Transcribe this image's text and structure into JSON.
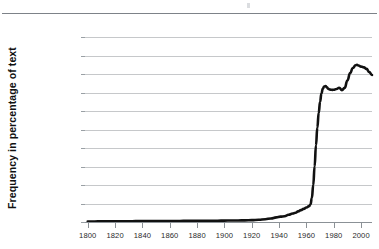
{
  "chart_data": {
    "type": "line",
    "title": "",
    "subtitle": "",
    "xlabel": "",
    "ylabel": "Frequency in percentage of text",
    "xlim": [
      1798,
      2008
    ],
    "ylim": [
      0.0,
      2e-05
    ],
    "grid": true,
    "legend": null,
    "legend_position": "none",
    "x_tick_labels": [
      "1800",
      "1820",
      "1840",
      "1860",
      "1880",
      "1900",
      "1920",
      "1940",
      "1960",
      "1980",
      "2000"
    ],
    "x_ticks": [
      1800,
      1820,
      1840,
      1860,
      1880,
      1900,
      1920,
      1940,
      1960,
      1980,
      2000
    ],
    "y_tick_labels": [
      "0.0000200",
      "0.0000180",
      "0.0000160",
      "0.0000140",
      "0.0000120",
      "0.0000100",
      "0.0000080",
      "0.0000060",
      "0.0000040",
      "0.0000020",
      "0.0000000"
    ],
    "y_ticks": [
      2e-05,
      1.8e-05,
      1.6e-05,
      1.4e-05,
      1.2e-05,
      1e-05,
      8e-06,
      6e-06,
      4e-06,
      2e-06,
      0.0
    ],
    "series": [
      {
        "name": "frequency",
        "color": "#111111",
        "x": [
          1800,
          1805,
          1810,
          1815,
          1820,
          1825,
          1830,
          1835,
          1840,
          1845,
          1850,
          1855,
          1860,
          1865,
          1870,
          1875,
          1880,
          1885,
          1890,
          1895,
          1900,
          1905,
          1910,
          1915,
          1920,
          1925,
          1930,
          1934,
          1938,
          1941,
          1944,
          1947,
          1950,
          1952,
          1954,
          1956,
          1958,
          1960,
          1962,
          1963,
          1964,
          1965,
          1966,
          1967,
          1968,
          1969,
          1970,
          1971,
          1972,
          1973,
          1974,
          1975,
          1976,
          1977,
          1978,
          1979,
          1980,
          1982,
          1984,
          1986,
          1988,
          1990,
          1992,
          1994,
          1996,
          1997,
          1998,
          2000,
          2002,
          2004,
          2006,
          2008
        ],
        "y": [
          6e-08,
          6e-08,
          7e-08,
          7e-08,
          8e-08,
          8e-08,
          8e-08,
          9e-08,
          9e-08,
          1e-07,
          1e-07,
          1e-07,
          1.1e-07,
          1.1e-07,
          1.2e-07,
          1.2e-07,
          1.3e-07,
          1.3e-07,
          1.4e-07,
          1.4e-07,
          1.5e-07,
          1.6e-07,
          1.7e-07,
          1.8e-07,
          2e-07,
          2.4e-07,
          3e-07,
          3.8e-07,
          5e-07,
          5.8e-07,
          6.2e-07,
          7.8e-07,
          9.2e-07,
          1e-06,
          1.15e-06,
          1.28e-06,
          1.42e-06,
          1.56e-06,
          1.72e-06,
          1.9e-06,
          2.6e-06,
          4e-06,
          6e-06,
          8.3e-06,
          1.02e-05,
          1.18e-05,
          1.3e-05,
          1.39e-05,
          1.44e-05,
          1.465e-05,
          1.47e-05,
          1.455e-05,
          1.44e-05,
          1.432e-05,
          1.43e-05,
          1.428e-05,
          1.43e-05,
          1.438e-05,
          1.452e-05,
          1.425e-05,
          1.45e-05,
          1.53e-05,
          1.61e-05,
          1.665e-05,
          1.695e-05,
          1.7e-05,
          1.692e-05,
          1.68e-05,
          1.672e-05,
          1.655e-05,
          1.62e-05,
          1.59e-05
        ]
      }
    ]
  },
  "axes": {
    "y_title": "Frequency in percentage of text"
  }
}
